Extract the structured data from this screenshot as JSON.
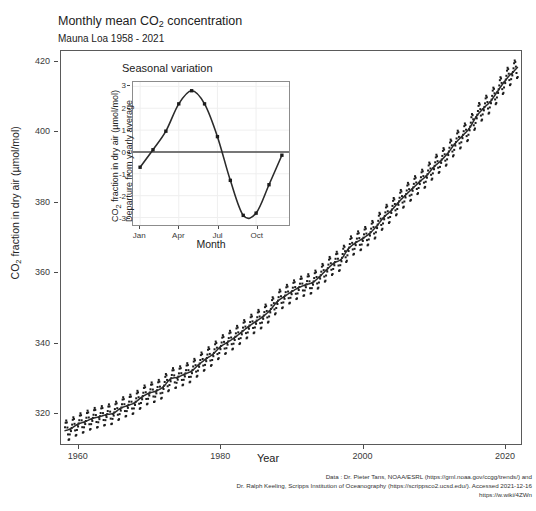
{
  "header": {
    "title_prefix": "Monthly mean CO",
    "title_sub": "2",
    "title_suffix": " concentration",
    "subtitle": "Mauna Loa 1958 - 2021"
  },
  "main_axes": {
    "y_title_prefix": "CO",
    "y_title_sub": "2",
    "y_title_suffix": " fraction in dry air (µmol/mol)",
    "x_title": "Year",
    "y_ticks": [
      320,
      340,
      360,
      380,
      400,
      420
    ],
    "x_ticks": [
      1960,
      1980,
      2000,
      2020
    ]
  },
  "inset": {
    "title": "Seasonal variation",
    "x_title": "Month",
    "y_title_line1_prefix": "CO",
    "y_title_line1_sub": "2",
    "y_title_line1_suffix": " fraction in dry air (µmol/mol)",
    "y_title_line2": "Departure from yearly average",
    "y_ticks": [
      -3,
      -2,
      -1,
      0,
      1,
      2,
      3
    ],
    "x_tick_labels": [
      "Jan",
      "Apr",
      "Jul",
      "Oct"
    ],
    "x_tick_months": [
      1,
      4,
      7,
      10
    ]
  },
  "footer": {
    "line1": "Data : Dr. Pieter Tans, NOAA/ESRL (https://gml.noaa.gov/ccgg/trends/) and",
    "line2": "Dr. Ralph Keeling, Scripps Institution of Oceanography (https://scrippsco2.ucsd.edu/). Accessed  2021-12-16",
    "line3": "https://w.wiki/4ZWn"
  },
  "colors": {
    "point": "#1c1c1c",
    "trend": "#2b2b2b",
    "panel_border": "#5a5a5a",
    "inset_border": "#8c8c8c",
    "zero_line": "#4d4d4d",
    "grid": "#efefef",
    "background": "#ffffff"
  },
  "chart_data": [
    {
      "type": "scatter",
      "name": "keeling-curve-main",
      "title": "Monthly mean CO2 concentration",
      "subtitle": "Mauna Loa 1958 - 2021",
      "xlabel": "Year",
      "ylabel": "CO2 fraction in dry air (µmol/mol)",
      "xlim": [
        1957.5,
        2022.4
      ],
      "ylim": [
        311.0,
        423.0
      ],
      "xticks": [
        1960,
        1980,
        2000,
        2020
      ],
      "yticks": [
        320,
        340,
        360,
        380,
        400,
        420
      ],
      "grid": false,
      "legend": "none",
      "series_note": "Monthly points = annual trend + seasonal departure; smooth line = annual trend",
      "annual_trend_years": [
        1958,
        1959,
        1960,
        1961,
        1962,
        1963,
        1964,
        1965,
        1966,
        1967,
        1968,
        1969,
        1970,
        1971,
        1972,
        1973,
        1974,
        1975,
        1976,
        1977,
        1978,
        1979,
        1980,
        1981,
        1982,
        1983,
        1984,
        1985,
        1986,
        1987,
        1988,
        1989,
        1990,
        1991,
        1992,
        1993,
        1994,
        1995,
        1996,
        1997,
        1998,
        1999,
        2000,
        2001,
        2002,
        2003,
        2004,
        2005,
        2006,
        2007,
        2008,
        2009,
        2010,
        2011,
        2012,
        2013,
        2014,
        2015,
        2016,
        2017,
        2018,
        2019,
        2020,
        2021
      ],
      "annual_trend_values": [
        315.0,
        315.6,
        316.9,
        317.6,
        318.5,
        319.0,
        319.6,
        320.0,
        321.4,
        322.2,
        323.0,
        324.6,
        325.7,
        326.3,
        327.5,
        329.7,
        330.2,
        331.1,
        332.0,
        333.8,
        335.4,
        336.8,
        338.8,
        340.1,
        341.4,
        343.0,
        344.6,
        346.0,
        347.4,
        349.2,
        351.6,
        353.1,
        354.4,
        355.6,
        356.4,
        357.1,
        358.8,
        360.8,
        362.6,
        363.7,
        366.6,
        368.3,
        369.5,
        371.0,
        373.1,
        375.6,
        377.4,
        379.7,
        381.8,
        383.7,
        385.6,
        387.4,
        389.8,
        391.6,
        393.8,
        396.5,
        398.6,
        400.8,
        404.2,
        406.5,
        408.5,
        411.4,
        414.2,
        416.4
      ],
      "seasonal_departures_monthly": [
        -0.7,
        0.1,
        0.95,
        2.2,
        2.8,
        2.2,
        0.7,
        -1.3,
        -2.9,
        -2.8,
        -1.5,
        -0.15
      ]
    },
    {
      "type": "line",
      "name": "seasonal-variation-inset",
      "title": "Seasonal variation",
      "xlabel": "Month",
      "ylabel": "CO2 fraction in dry air (µmol/mol) - Departure from yearly average",
      "categories": [
        "Jan",
        "Feb",
        "Mar",
        "Apr",
        "May",
        "Jun",
        "Jul",
        "Aug",
        "Sep",
        "Oct",
        "Nov",
        "Dec"
      ],
      "values": [
        -0.7,
        0.1,
        0.95,
        2.2,
        2.8,
        2.2,
        0.7,
        -1.3,
        -2.9,
        -2.8,
        -1.5,
        -0.15
      ],
      "xlim": [
        0.45,
        12.55
      ],
      "ylim": [
        -3.35,
        3.2
      ],
      "yticks": [
        -3,
        -2,
        -1,
        0,
        1,
        2,
        3
      ],
      "xticks": [
        1,
        4,
        7,
        10
      ],
      "xticklabels": [
        "Jan",
        "Apr",
        "Jul",
        "Oct"
      ],
      "markers": "filled-square",
      "zero_reference_line": 0,
      "grid": true,
      "legend": "none"
    }
  ]
}
